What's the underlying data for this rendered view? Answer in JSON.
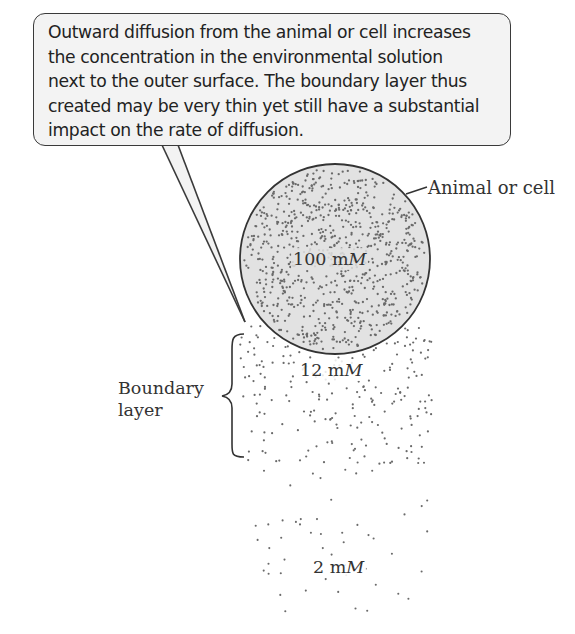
{
  "callout": {
    "lines": [
      "Outward diffusion from the animal or cell increases",
      "the concentration in the environmental solution",
      "next to the outer surface. The boundary layer thus",
      "created may be very thin yet still have a substantial",
      "impact on the rate of diffusion."
    ]
  },
  "labels": {
    "cell": "Animal or cell",
    "boundary_line1": "Boundary",
    "boundary_line2": "layer",
    "conc_inside_value": "100 m",
    "conc_inside_unit": "M",
    "conc_boundary_value": "12 m",
    "conc_boundary_unit": "M",
    "conc_bulk_value": "2 m",
    "conc_bulk_unit": "M"
  },
  "concentrations": {
    "cell_interior_mM": 100,
    "boundary_layer_mM": 12,
    "bulk_solution_mM": 2
  },
  "colors": {
    "cell_fill": "#e2e2e2",
    "cell_outline": "#333333",
    "dot": "#6a6a6a",
    "bubble_fill": "#f3f3f3",
    "bubble_outline": "#3a3a3a"
  },
  "geometry": {
    "cell": {
      "cx": 335,
      "cy": 259,
      "r": 95
    },
    "dots": {
      "cell_count": 780,
      "boundary_count": 210,
      "bulk_count": 55
    }
  }
}
